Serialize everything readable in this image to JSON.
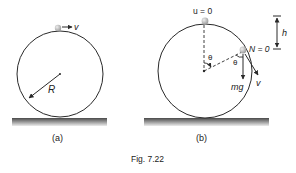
{
  "figure": {
    "caption": "Fig. 7.22",
    "panels": [
      {
        "id": "a",
        "label": "(a)",
        "velocity_label": "v",
        "radius_label": "R"
      },
      {
        "id": "b",
        "label": "(b)",
        "initial_velocity_label": "u = 0",
        "normal_label": "N = 0",
        "height_label": "h",
        "angle_label_center": "θ",
        "angle_label_ball": "θ",
        "weight_label": "mg",
        "velocity_label": "v"
      }
    ]
  },
  "colors": {
    "line": "#2a2a2a",
    "ball": "#b5b5b5",
    "ground_top": "#555555",
    "ground_bottom": "#e6e6e6"
  }
}
